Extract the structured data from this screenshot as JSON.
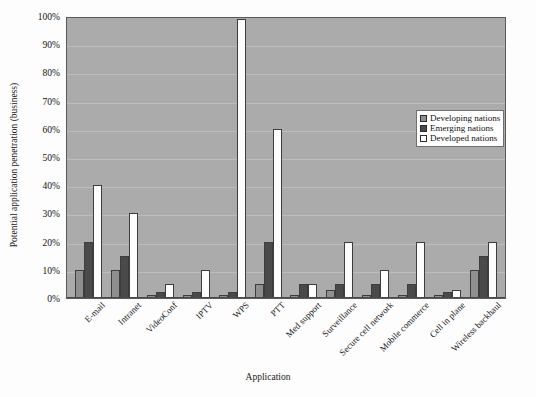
{
  "chart_data": {
    "type": "bar",
    "title": "",
    "xlabel": "Application",
    "ylabel": "Potential application penetration (business)",
    "ylim": [
      0,
      100
    ],
    "ytick_labels": [
      "0%",
      "10%",
      "20%",
      "30%",
      "40%",
      "50%",
      "60%",
      "70%",
      "80%",
      "90%",
      "100%"
    ],
    "ytick_values": [
      0,
      10,
      20,
      30,
      40,
      50,
      60,
      70,
      80,
      90,
      100
    ],
    "grid": true,
    "legend_position": "upper-right",
    "categories": [
      "E-mail",
      "Intranet",
      "VideoConf",
      "IPTV",
      "WPS",
      "PTT",
      "Med support",
      "Surveillance",
      "Secure cell network",
      "Mobile commerce",
      "Cell in plane",
      "Wireless backhaul"
    ],
    "series": [
      {
        "name": "Developing nations",
        "color": "#8f8f8f",
        "values": [
          10,
          10,
          1,
          1,
          1,
          5,
          1,
          3,
          1,
          1,
          1,
          10
        ]
      },
      {
        "name": "Emerging nations",
        "color": "#4a4a4a",
        "values": [
          20,
          15,
          2,
          2,
          2,
          20,
          5,
          5,
          5,
          5,
          2,
          15
        ]
      },
      {
        "name": "Developed nations",
        "color": "#fdfdfd",
        "values": [
          40,
          30,
          5,
          10,
          99,
          60,
          5,
          20,
          10,
          20,
          3,
          20
        ]
      }
    ]
  },
  "plot": {
    "background_color": "#ababab",
    "gridline_color": "#bdbdbd",
    "border_color": "#5a5a5a"
  }
}
